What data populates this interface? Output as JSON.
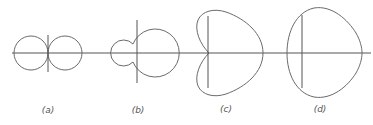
{
  "figure": {
    "colors": {
      "stroke": "#6a6a6a",
      "axis": "#555555",
      "background": "#ffffff"
    },
    "panels": [
      {
        "id": "a",
        "label": "(a)",
        "shape": "figure-eight (two equal tangent lobes)"
      },
      {
        "id": "b",
        "label": "(b)",
        "shape": "limaçon with small inner back lobe"
      },
      {
        "id": "c",
        "label": "(c)",
        "shape": "cardioid"
      },
      {
        "id": "d",
        "label": "(d)",
        "shape": "convex limaçon"
      }
    ]
  }
}
